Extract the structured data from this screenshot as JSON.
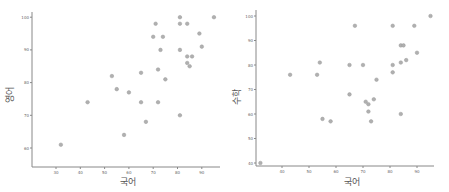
{
  "chart_data": [
    {
      "type": "scatter",
      "title": "",
      "xlabel": "국어",
      "ylabel": "영어",
      "xticks": [
        30,
        40,
        50,
        60,
        70,
        80,
        90
      ],
      "yticks": [
        60,
        70,
        80,
        90,
        100
      ],
      "grid": false,
      "x": [
        32,
        43,
        53,
        55,
        60,
        58,
        65,
        65,
        67,
        70,
        71,
        72,
        72,
        73,
        74,
        75,
        81,
        81,
        81,
        81,
        84,
        84,
        86,
        84,
        85,
        89,
        90,
        95
      ],
      "y": [
        61,
        74,
        82,
        78,
        77,
        64,
        83,
        74,
        68,
        94,
        98,
        84,
        74,
        90,
        94,
        81,
        100,
        98,
        90,
        70,
        98,
        88,
        88,
        86,
        85,
        95,
        91,
        100
      ]
    },
    {
      "type": "scatter",
      "title": "",
      "xlabel": "국어",
      "ylabel": "수학",
      "xticks": [
        40,
        50,
        60,
        70,
        80,
        90
      ],
      "yticks": [
        40,
        50,
        60,
        70,
        80,
        90,
        100
      ],
      "grid": false,
      "x": [
        32,
        43,
        53,
        54,
        55,
        58,
        65,
        65,
        67,
        70,
        71,
        72,
        72,
        73,
        74,
        75,
        81,
        81,
        81,
        84,
        84,
        84,
        85,
        86,
        89,
        90,
        95
      ],
      "y": [
        40,
        76,
        76,
        81,
        58,
        57,
        80,
        68,
        96,
        80,
        65,
        64,
        61,
        57,
        66,
        74,
        96,
        80,
        77,
        81,
        60,
        88,
        88,
        82,
        96,
        85,
        100
      ]
    }
  ],
  "colors": {
    "point": "#b0b0b0",
    "axis": "#888888",
    "text": "#555555"
  }
}
